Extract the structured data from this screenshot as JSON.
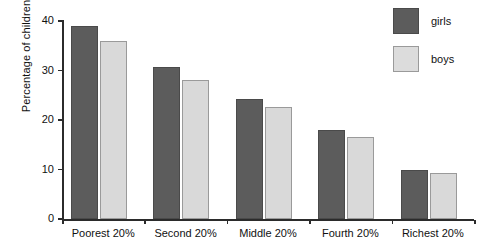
{
  "chart_data": {
    "type": "bar",
    "title": "",
    "xlabel": "",
    "ylabel": "Percentage of children",
    "categories": [
      "Poorest 20%",
      "Second 20%",
      "Middle 20%",
      "Fourth 20%",
      "Richest 20%"
    ],
    "series": [
      {
        "name": "girls",
        "color": "#5c5c5c",
        "values": [
          39.0,
          30.7,
          24.3,
          18.0,
          10.0
        ]
      },
      {
        "name": "boys",
        "color": "#d9d9d9",
        "values": [
          36.0,
          28.0,
          22.6,
          16.5,
          9.2
        ]
      }
    ],
    "ylim": [
      0,
      40
    ],
    "yticks": [
      0,
      10,
      20,
      30,
      40
    ],
    "ytick_labels": [
      "0",
      "10",
      "20",
      "30",
      "40"
    ],
    "grid": false,
    "legend_position": "top-right",
    "legend": [
      "girls",
      "boys"
    ]
  }
}
